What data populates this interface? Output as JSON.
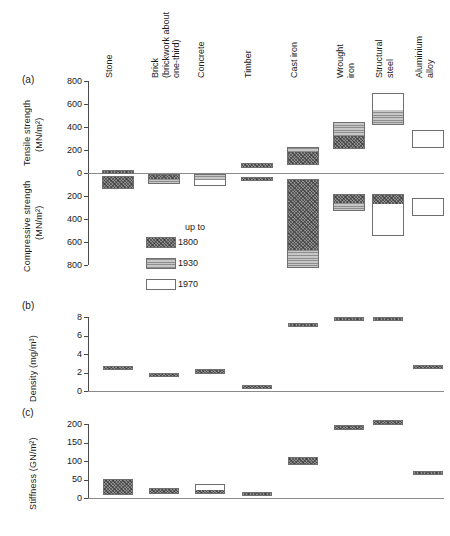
{
  "figure": {
    "panels": [
      {
        "id": "a",
        "letter": "(a)"
      },
      {
        "id": "b",
        "letter": "(b)"
      },
      {
        "id": "c",
        "letter": "(c)"
      }
    ],
    "materials": [
      {
        "key": "stone",
        "label": "Stone"
      },
      {
        "key": "brick",
        "label": "Brick\n(brickwork about\none-third)"
      },
      {
        "key": "concrete",
        "label": "Concrete"
      },
      {
        "key": "timber",
        "label": "Timber"
      },
      {
        "key": "cast-iron",
        "label": "Cast iron"
      },
      {
        "key": "wrought-iron",
        "label": "Wrought\niron"
      },
      {
        "key": "structural-steel",
        "label": "Structural\nsteel"
      },
      {
        "key": "aluminium-alloy",
        "label": "Aluminium\nalloy"
      }
    ],
    "legend": {
      "title": "up to",
      "entries": [
        {
          "key": "1800",
          "label": "1800",
          "fill": "fill-1800"
        },
        {
          "key": "1930",
          "label": "1930",
          "fill": "fill-1930"
        },
        {
          "key": "1970",
          "label": "1970",
          "fill": "fill-1970"
        }
      ]
    },
    "axis_a": {
      "tensile_label": "Tensile strength",
      "tensile_units": "(MN/m²)",
      "compressive_label": "Compressive strength",
      "compressive_units": "(MN/m²)",
      "ticks_tensile": [
        "800",
        "600",
        "400",
        "200",
        "0"
      ],
      "ticks_compressive": [
        "200",
        "400",
        "600",
        "800"
      ]
    },
    "axis_b": {
      "label": "Density (mg/m³)",
      "ticks": [
        "8",
        "6",
        "4",
        "2",
        "0"
      ]
    },
    "axis_c": {
      "label": "Stiffness (GN/m²)",
      "ticks": [
        "200",
        "150",
        "100",
        "50",
        "0"
      ]
    }
  },
  "chart_data": [
    {
      "type": "bar",
      "panel": "a",
      "title": "",
      "xlabel": "",
      "ylabel": "Tensile strength (MN/m2)  /  Compressive strength (MN/m2)",
      "ylim": [
        -800,
        800
      ],
      "note": "Positive values are tensile strength; negative values are compressive strength. Each bar is a range split into historical segments.",
      "categories": [
        "Stone",
        "Brick (brickwork about one-third)",
        "Concrete",
        "Timber",
        "Cast iron",
        "Wrought iron",
        "Structural steel",
        "Aluminium alloy"
      ],
      "series": [
        {
          "name": "Tensile strength range (MN/m2)",
          "bars": [
            {
              "category": "Stone",
              "low": 5,
              "high": 25,
              "segments": [
                {
                  "era": "1800",
                  "from": 5,
                  "to": 25
                }
              ]
            },
            {
              "category": "Brick (brickwork about one-third)",
              "low": 0,
              "high": 0,
              "segments": []
            },
            {
              "category": "Concrete",
              "low": 0,
              "high": 0,
              "segments": []
            },
            {
              "category": "Timber",
              "low": 40,
              "high": 85,
              "segments": [
                {
                  "era": "1800",
                  "from": 40,
                  "to": 85
                }
              ]
            },
            {
              "category": "Cast iron",
              "low": 70,
              "high": 230,
              "segments": [
                {
                  "era": "1800",
                  "from": 70,
                  "to": 190
                },
                {
                  "era": "1930",
                  "from": 190,
                  "to": 230
                }
              ]
            },
            {
              "category": "Wrought iron",
              "low": 205,
              "high": 440,
              "segments": [
                {
                  "era": "1800",
                  "from": 205,
                  "to": 330
                },
                {
                  "era": "1930",
                  "from": 330,
                  "to": 440
                }
              ]
            },
            {
              "category": "Structural steel",
              "low": 420,
              "high": 700,
              "segments": [
                {
                  "era": "1930",
                  "from": 420,
                  "to": 560
                },
                {
                  "era": "1970",
                  "from": 560,
                  "to": 700
                }
              ]
            },
            {
              "category": "Aluminium alloy",
              "low": 220,
              "high": 370,
              "segments": [
                {
                  "era": "1970",
                  "from": 220,
                  "to": 370
                }
              ]
            }
          ]
        },
        {
          "name": "Compressive strength range (MN/m2)",
          "bars": [
            {
              "category": "Stone",
              "low": 30,
              "high": 140,
              "segments": [
                {
                  "era": "1800",
                  "from": 30,
                  "to": 140
                }
              ]
            },
            {
              "category": "Brick (brickwork about one-third)",
              "low": 10,
              "high": 95,
              "segments": [
                {
                  "era": "1800",
                  "from": 10,
                  "to": 45
                },
                {
                  "era": "1930",
                  "from": 45,
                  "to": 95
                }
              ]
            },
            {
              "category": "Concrete",
              "low": 10,
              "high": 110,
              "segments": [
                {
                  "era": "1930",
                  "from": 10,
                  "to": 55
                },
                {
                  "era": "1970",
                  "from": 55,
                  "to": 110
                }
              ]
            },
            {
              "category": "Timber",
              "low": 35,
              "high": 70,
              "segments": [
                {
                  "era": "1800",
                  "from": 35,
                  "to": 70
                }
              ]
            },
            {
              "category": "Cast iron",
              "low": 50,
              "high": 830,
              "segments": [
                {
                  "era": "1800",
                  "from": 50,
                  "to": 660
                },
                {
                  "era": "1930",
                  "from": 660,
                  "to": 830
                }
              ]
            },
            {
              "category": "Wrought iron",
              "low": 180,
              "high": 330,
              "segments": [
                {
                  "era": "1800",
                  "from": 180,
                  "to": 250
                },
                {
                  "era": "1930",
                  "from": 250,
                  "to": 330
                }
              ]
            },
            {
              "category": "Structural steel",
              "low": 180,
              "high": 550,
              "segments": [
                {
                  "era": "1800",
                  "from": 180,
                  "to": 260
                },
                {
                  "era": "1970",
                  "from": 260,
                  "to": 550
                }
              ]
            },
            {
              "category": "Aluminium alloy",
              "low": 220,
              "high": 370,
              "segments": [
                {
                  "era": "1970",
                  "from": 220,
                  "to": 370
                }
              ]
            }
          ]
        }
      ]
    },
    {
      "type": "bar",
      "panel": "b",
      "title": "",
      "xlabel": "",
      "ylabel": "Density (mg/m3)",
      "ylim": [
        0,
        8
      ],
      "categories": [
        "Stone",
        "Brick (brickwork about one-third)",
        "Concrete",
        "Timber",
        "Cast iron",
        "Wrought iron",
        "Structural steel",
        "Aluminium alloy"
      ],
      "series": [
        {
          "name": "Density range (mg/m3)",
          "bars": [
            {
              "category": "Stone",
              "low": 2.3,
              "high": 2.7,
              "segments": [
                {
                  "era": "1800",
                  "from": 2.3,
                  "to": 2.7
                }
              ]
            },
            {
              "category": "Brick (brickwork about one-third)",
              "low": 1.7,
              "high": 1.95,
              "segments": [
                {
                  "era": "1800",
                  "from": 1.7,
                  "to": 1.95
                }
              ]
            },
            {
              "category": "Concrete",
              "low": 1.85,
              "high": 2.35,
              "segments": [
                {
                  "era": "1800",
                  "from": 1.85,
                  "to": 2.35
                }
              ]
            },
            {
              "category": "Timber",
              "low": 0.45,
              "high": 0.7,
              "segments": [
                {
                  "era": "1800",
                  "from": 0.45,
                  "to": 0.7
                }
              ]
            },
            {
              "category": "Cast iron",
              "low": 7.0,
              "high": 7.3,
              "segments": [
                {
                  "era": "1800",
                  "from": 7.0,
                  "to": 7.3
                }
              ]
            },
            {
              "category": "Wrought iron",
              "low": 7.65,
              "high": 7.95,
              "segments": [
                {
                  "era": "1800",
                  "from": 7.65,
                  "to": 7.95
                }
              ]
            },
            {
              "category": "Structural steel",
              "low": 7.65,
              "high": 7.95,
              "segments": [
                {
                  "era": "1800",
                  "from": 7.65,
                  "to": 7.95
                }
              ]
            },
            {
              "category": "Aluminium alloy",
              "low": 2.6,
              "high": 2.85,
              "segments": [
                {
                  "era": "1800",
                  "from": 2.6,
                  "to": 2.85
                }
              ]
            }
          ]
        }
      ]
    },
    {
      "type": "bar",
      "panel": "c",
      "title": "",
      "xlabel": "",
      "ylabel": "Stiffness (GN/m2)",
      "ylim": [
        0,
        200
      ],
      "categories": [
        "Stone",
        "Brick (brickwork about one-third)",
        "Concrete",
        "Timber",
        "Cast iron",
        "Wrought iron",
        "Structural steel",
        "Aluminium alloy"
      ],
      "series": [
        {
          "name": "Stiffness range (GN/m2)",
          "bars": [
            {
              "category": "Stone",
              "low": 8,
              "high": 52,
              "segments": [
                {
                  "era": "1800",
                  "from": 8,
                  "to": 52
                }
              ]
            },
            {
              "category": "Brick (brickwork about one-third)",
              "low": 10,
              "high": 26,
              "segments": [
                {
                  "era": "1800",
                  "from": 10,
                  "to": 26
                }
              ]
            },
            {
              "category": "Concrete",
              "low": 10,
              "high": 38,
              "segments": [
                {
                  "era": "1800",
                  "from": 10,
                  "to": 24
                },
                {
                  "era": "1970",
                  "from": 24,
                  "to": 38
                }
              ]
            },
            {
              "category": "Timber",
              "low": 8,
              "high": 16,
              "segments": [
                {
                  "era": "1800",
                  "from": 8,
                  "to": 16
                }
              ]
            },
            {
              "category": "Cast iron",
              "low": 88,
              "high": 110,
              "segments": [
                {
                  "era": "1800",
                  "from": 88,
                  "to": 110
                }
              ]
            },
            {
              "category": "Wrought iron",
              "low": 183,
              "high": 196,
              "segments": [
                {
                  "era": "1800",
                  "from": 183,
                  "to": 196
                }
              ]
            },
            {
              "category": "Structural steel",
              "low": 198,
              "high": 212,
              "segments": [
                {
                  "era": "1800",
                  "from": 198,
                  "to": 212
                }
              ]
            },
            {
              "category": "Aluminium alloy",
              "low": 66,
              "high": 74,
              "segments": [
                {
                  "era": "1800",
                  "from": 66,
                  "to": 74
                }
              ]
            }
          ]
        }
      ]
    }
  ]
}
